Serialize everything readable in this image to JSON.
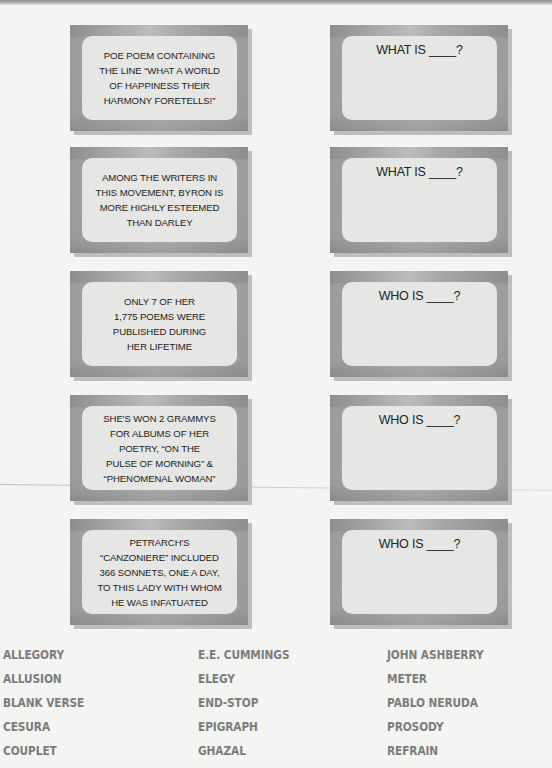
{
  "clues": [
    {
      "text": "POE POEM CONTAINING\nTHE LINE “WHAT A WORLD\nOF HAPPINESS THEIR\nHARMONY FORETELLS!”",
      "response": "WHAT IS ____?"
    },
    {
      "text": "AMONG THE WRITERS IN\nTHIS MOVEMENT, BYRON IS\nMORE HIGHLY ESTEEMED\nTHAN DARLEY",
      "response": "WHAT IS ____?"
    },
    {
      "text": "ONLY 7 OF HER\n1,775 POEMS WERE\nPUBLISHED DURING\nHER LIFETIME",
      "response": "WHO IS ____?"
    },
    {
      "text": "SHE'S WON 2 GRAMMYS\nFOR ALBUMS OF HER\nPOETRY, “ON THE\nPULSE OF MORNING” &\n“PHENOMENAL WOMAN”",
      "response": "WHO IS ____?"
    },
    {
      "text": "PETRARCH'S\n“CANZONIERE” INCLUDED\n366 SONNETS, ONE A DAY,\nTO THIS LADY WITH WHOM\nHE WAS INFATUATED",
      "response": "WHO IS ____?"
    }
  ],
  "word_bank": {
    "columns": [
      [
        "ALLEGORY",
        "ALLUSION",
        "BLANK VERSE",
        "CESURA",
        "COUPLET"
      ],
      [
        "E.E. CUMMINGS",
        "ELEGY",
        "END-STOP",
        "EPIGRAPH",
        "GHAZAL"
      ],
      [
        "JOHN ASHBERRY",
        "METER",
        "PABLO NERUDA",
        "PROSODY",
        "REFRAIN"
      ]
    ]
  },
  "colors": {
    "page_background": "#f4f4f2",
    "card_frame": "#9a9a9a",
    "card_panel": "#e6e6e4",
    "card_text": "#222222",
    "word_bank_text": "#7c7c7c"
  }
}
